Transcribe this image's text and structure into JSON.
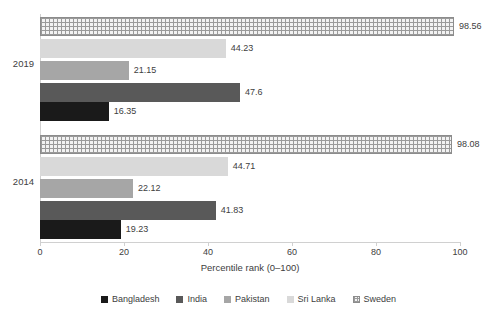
{
  "chart_data": {
    "type": "bar",
    "orientation": "horizontal",
    "title": "",
    "xlabel": "Percentile rank (0–100)",
    "ylabel": "",
    "xlim": [
      0,
      100
    ],
    "xticks": [
      "0",
      "20",
      "40",
      "60",
      "80",
      "100"
    ],
    "grid": false,
    "legend_position": "bottom",
    "categories": [
      "2019",
      "2014"
    ],
    "series": [
      {
        "name": "Bangladesh",
        "color": "#1a1a1a",
        "values": [
          16.35,
          19.23
        ]
      },
      {
        "name": "India",
        "color": "#595959",
        "values": [
          47.6,
          41.83
        ]
      },
      {
        "name": "Pakistan",
        "color": "#a6a6a6",
        "values": [
          21.15,
          22.12
        ]
      },
      {
        "name": "Sri Lanka",
        "color": "#d9d9d9",
        "values": [
          44.23,
          44.71
        ]
      },
      {
        "name": "Sweden",
        "color": "#f2f2f2",
        "pattern": "dotted",
        "values": [
          98.56,
          98.08
        ]
      }
    ],
    "bar_order_top_to_bottom": [
      "Sweden",
      "Sri Lanka",
      "Pakistan",
      "India",
      "Bangladesh"
    ]
  },
  "axis": {
    "x_title": "Percentile rank (0–100)",
    "ticks": [
      {
        "label": "0",
        "value": 0
      },
      {
        "label": "20",
        "value": 20
      },
      {
        "label": "40",
        "value": 40
      },
      {
        "label": "60",
        "value": 60
      },
      {
        "label": "80",
        "value": 80
      },
      {
        "label": "100",
        "value": 100
      }
    ],
    "categories": [
      {
        "label": "2019"
      },
      {
        "label": "2014"
      }
    ]
  },
  "groups": {
    "g2019": {
      "label": "2019",
      "bars": [
        {
          "series": "Sweden",
          "value": 98.56,
          "label": "98.56"
        },
        {
          "series": "Sri Lanka",
          "value": 44.23,
          "label": "44.23"
        },
        {
          "series": "Pakistan",
          "value": 21.15,
          "label": "21.15"
        },
        {
          "series": "India",
          "value": 47.6,
          "label": "47.6"
        },
        {
          "series": "Bangladesh",
          "value": 16.35,
          "label": "16.35"
        }
      ]
    },
    "g2014": {
      "label": "2014",
      "bars": [
        {
          "series": "Sweden",
          "value": 98.08,
          "label": "98.08"
        },
        {
          "series": "Sri Lanka",
          "value": 44.71,
          "label": "44.71"
        },
        {
          "series": "Pakistan",
          "value": 22.12,
          "label": "22.12"
        },
        {
          "series": "India",
          "value": 41.83,
          "label": "41.83"
        },
        {
          "series": "Bangladesh",
          "value": 19.23,
          "label": "19.23"
        }
      ]
    }
  },
  "legend": {
    "items": [
      {
        "label": "Bangladesh",
        "swatch": "bangladesh-swatch"
      },
      {
        "label": "India",
        "swatch": "india-swatch"
      },
      {
        "label": "Pakistan",
        "swatch": "pakistan-swatch"
      },
      {
        "label": "Sri Lanka",
        "swatch": "srilanka-swatch"
      },
      {
        "label": "Sweden",
        "swatch": "sweden-swatch"
      }
    ]
  }
}
